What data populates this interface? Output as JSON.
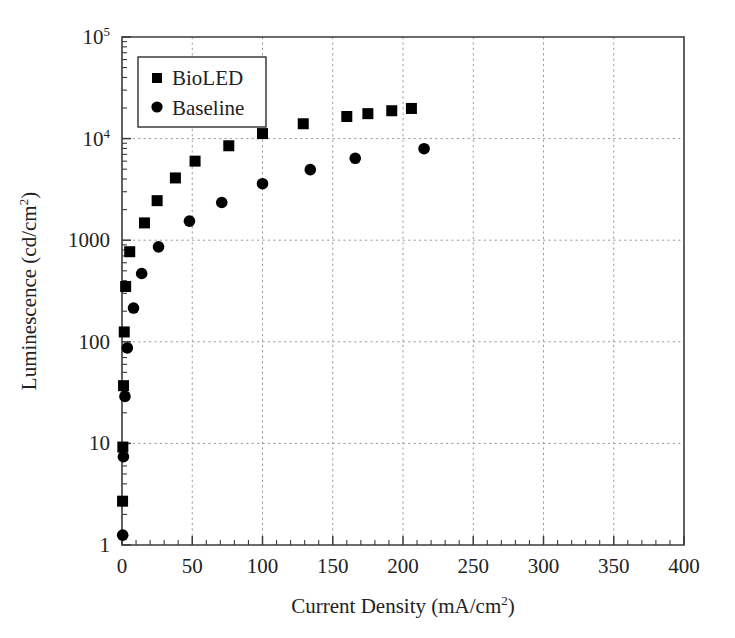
{
  "chart_data": {
    "type": "scatter",
    "title": "",
    "xlabel": "Current Density (mA/cm2)",
    "xlabel_base": "Current Density (mA/cm",
    "xlabel_sup": "2",
    "xlabel_tail": ")",
    "ylabel": "Luminescence (cd/cm2)",
    "ylabel_base": "Luminescence (cd/cm",
    "ylabel_sup": "2",
    "ylabel_tail": ")",
    "xscale": "linear",
    "yscale": "log",
    "xlim": [
      0,
      400
    ],
    "ylim": [
      1,
      100000
    ],
    "grid": true,
    "grid_style": "dotted",
    "legend_position": "upper-left",
    "xticks": [
      0,
      50,
      100,
      150,
      200,
      250,
      300,
      350,
      400
    ],
    "xtick_labels": [
      "0",
      "50",
      "100",
      "150",
      "200",
      "250",
      "300",
      "350",
      "400"
    ],
    "x_minor_step": 10,
    "yticks": [
      1,
      10,
      100,
      1000,
      10000,
      100000
    ],
    "ytick_labels": [
      "1",
      "10",
      "100",
      "1000",
      "10",
      "10"
    ],
    "ytick_label_full": [
      "1",
      "10",
      "100",
      "1000",
      "10^4",
      "10^5"
    ],
    "series": [
      {
        "name": "BioLED",
        "marker": "square",
        "color": "#000000",
        "points": [
          [
            0.4,
            2.7
          ],
          [
            0.6,
            9.2
          ],
          [
            1.1,
            37
          ],
          [
            1.6,
            125
          ],
          [
            2.6,
            350
          ],
          [
            5.5,
            770
          ],
          [
            16,
            1480
          ],
          [
            25,
            2450
          ],
          [
            38,
            4100
          ],
          [
            52,
            6000
          ],
          [
            76,
            8500
          ],
          [
            100,
            11200
          ],
          [
            129,
            14000
          ],
          [
            160,
            16500
          ],
          [
            175,
            17600
          ],
          [
            192,
            18800
          ],
          [
            206,
            19800
          ]
        ]
      },
      {
        "name": "Baseline",
        "marker": "circle",
        "color": "#000000",
        "points": [
          [
            0.5,
            1.25
          ],
          [
            1.0,
            7.4
          ],
          [
            2.1,
            29
          ],
          [
            3.8,
            87
          ],
          [
            8.2,
            215
          ],
          [
            14,
            470
          ],
          [
            26,
            860
          ],
          [
            48,
            1540
          ],
          [
            71,
            2350
          ],
          [
            100,
            3600
          ],
          [
            134,
            4950
          ],
          [
            166,
            6400
          ],
          [
            215,
            7950
          ]
        ]
      }
    ],
    "legend_entries": [
      {
        "label": "BioLED",
        "marker": "square"
      },
      {
        "label": "Baseline",
        "marker": "circle"
      }
    ]
  },
  "figure": {
    "background": "#ffffff",
    "axis_color": "#3b3b3b",
    "grid_color": "#9a9a9a",
    "marker_color": "#000000"
  }
}
